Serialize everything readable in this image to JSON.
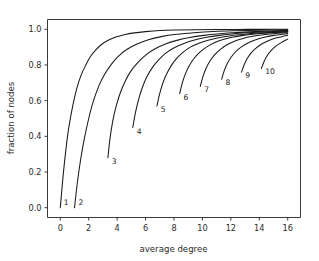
{
  "chart_data": {
    "type": "line",
    "title": "",
    "xlabel": "average degree",
    "ylabel": "fraction of nodes",
    "xlim": [
      -0.9,
      16.9
    ],
    "ylim": [
      -0.055,
      1.055
    ],
    "xticks": [
      0,
      2,
      4,
      6,
      8,
      10,
      12,
      14,
      16
    ],
    "xticklabels": [
      "0",
      "2",
      "4",
      "6",
      "8",
      "10",
      "12",
      "14",
      "16"
    ],
    "yticks": [
      0.0,
      0.2,
      0.4,
      0.6,
      0.8,
      1.0
    ],
    "yticklabels": [
      "0.0",
      "0.2",
      "0.4",
      "0.6",
      "0.8",
      "1.0"
    ],
    "grid": false,
    "legend_position": "inline-curve-labels",
    "line_color": "#1a1a1a",
    "frame_color": "#3a3a3a",
    "background_color": "#ffffff",
    "series": [
      {
        "name": "1",
        "label": "1",
        "label_x": 0.25,
        "label_y": 0.015,
        "x": [
          0.0,
          0.2,
          0.4,
          0.6,
          0.9,
          1.2,
          1.5,
          1.8,
          2.1,
          2.5,
          2.9,
          3.4,
          3.9,
          4.5,
          5.2,
          6.0,
          7.0,
          8.2,
          9.5,
          11.0,
          12.6,
          14.2,
          16.0
        ],
        "y": [
          0.0,
          0.18,
          0.33,
          0.45,
          0.58,
          0.68,
          0.75,
          0.8,
          0.845,
          0.885,
          0.915,
          0.94,
          0.957,
          0.97,
          0.98,
          0.987,
          0.993,
          0.996,
          0.998,
          0.999,
          0.9995,
          0.9998,
          1.0
        ]
      },
      {
        "name": "2",
        "label": "2",
        "label_x": 1.28,
        "label_y": 0.015,
        "x": [
          1.0,
          1.2,
          1.45,
          1.7,
          2.0,
          2.3,
          2.7,
          3.1,
          3.6,
          4.1,
          4.7,
          5.4,
          6.2,
          7.1,
          8.2,
          9.4,
          10.8,
          12.3,
          14.0,
          16.0
        ],
        "y": [
          0.0,
          0.14,
          0.28,
          0.39,
          0.5,
          0.59,
          0.68,
          0.745,
          0.805,
          0.85,
          0.888,
          0.918,
          0.942,
          0.959,
          0.972,
          0.981,
          0.988,
          0.992,
          0.995,
          0.997
        ]
      },
      {
        "name": "3",
        "label": "3",
        "label_x": 3.62,
        "label_y": 0.245,
        "x": [
          3.35,
          3.5,
          3.7,
          3.95,
          4.25,
          4.6,
          5.0,
          5.5,
          6.05,
          6.7,
          7.4,
          8.2,
          9.1,
          10.1,
          11.2,
          12.4,
          13.7,
          16.0
        ],
        "y": [
          0.28,
          0.39,
          0.49,
          0.575,
          0.65,
          0.715,
          0.77,
          0.818,
          0.858,
          0.892,
          0.918,
          0.938,
          0.954,
          0.966,
          0.975,
          0.982,
          0.987,
          0.994
        ]
      },
      {
        "name": "4",
        "label": "4",
        "label_x": 5.38,
        "label_y": 0.415,
        "x": [
          5.1,
          5.28,
          5.5,
          5.78,
          6.1,
          6.5,
          6.95,
          7.45,
          8.05,
          8.7,
          9.45,
          10.3,
          11.2,
          12.2,
          13.3,
          14.5,
          16.0
        ],
        "y": [
          0.45,
          0.53,
          0.605,
          0.675,
          0.735,
          0.788,
          0.832,
          0.868,
          0.898,
          0.921,
          0.94,
          0.955,
          0.966,
          0.975,
          0.981,
          0.986,
          0.991
        ]
      },
      {
        "name": "5",
        "label": "5",
        "label_x": 7.06,
        "label_y": 0.535,
        "x": [
          6.8,
          6.98,
          7.2,
          7.48,
          7.82,
          8.2,
          8.65,
          9.15,
          9.75,
          10.4,
          11.15,
          12.0,
          12.9,
          13.9,
          15.0,
          16.0
        ],
        "y": [
          0.57,
          0.635,
          0.695,
          0.75,
          0.798,
          0.838,
          0.872,
          0.9,
          0.922,
          0.939,
          0.953,
          0.964,
          0.972,
          0.979,
          0.984,
          0.987
        ]
      },
      {
        "name": "6",
        "label": "6",
        "label_x": 8.66,
        "label_y": 0.605,
        "x": [
          8.4,
          8.58,
          8.8,
          9.08,
          9.42,
          9.82,
          10.28,
          10.8,
          11.4,
          12.08,
          12.85,
          13.7,
          14.65,
          16.0
        ],
        "y": [
          0.64,
          0.698,
          0.75,
          0.797,
          0.838,
          0.872,
          0.9,
          0.923,
          0.941,
          0.955,
          0.966,
          0.974,
          0.98,
          0.986
        ]
      },
      {
        "name": "7",
        "label": "7",
        "label_x": 10.12,
        "label_y": 0.648,
        "x": [
          9.85,
          10.03,
          10.25,
          10.53,
          10.87,
          11.27,
          11.73,
          12.25,
          12.85,
          13.53,
          14.3,
          15.15,
          16.0
        ],
        "y": [
          0.68,
          0.733,
          0.78,
          0.822,
          0.858,
          0.888,
          0.913,
          0.933,
          0.949,
          0.961,
          0.97,
          0.977,
          0.981
        ]
      },
      {
        "name": "8",
        "label": "8",
        "label_x": 11.62,
        "label_y": 0.69,
        "x": [
          11.35,
          11.53,
          11.75,
          12.03,
          12.37,
          12.77,
          13.23,
          13.75,
          14.35,
          15.03,
          15.8,
          16.0
        ],
        "y": [
          0.72,
          0.767,
          0.808,
          0.845,
          0.877,
          0.903,
          0.925,
          0.942,
          0.955,
          0.966,
          0.974,
          0.976
        ]
      },
      {
        "name": "9",
        "label": "9",
        "label_x": 13.02,
        "label_y": 0.727,
        "x": [
          12.75,
          12.93,
          13.15,
          13.43,
          13.77,
          14.17,
          14.63,
          15.15,
          15.73,
          16.0
        ],
        "y": [
          0.76,
          0.8,
          0.836,
          0.868,
          0.895,
          0.918,
          0.936,
          0.951,
          0.962,
          0.966
        ]
      },
      {
        "name": "10",
        "label": "10",
        "label_x": 14.42,
        "label_y": 0.748,
        "x": [
          14.15,
          14.33,
          14.55,
          14.83,
          15.17,
          15.57,
          16.0
        ],
        "y": [
          0.78,
          0.818,
          0.852,
          0.881,
          0.906,
          0.927,
          0.945
        ]
      }
    ]
  }
}
